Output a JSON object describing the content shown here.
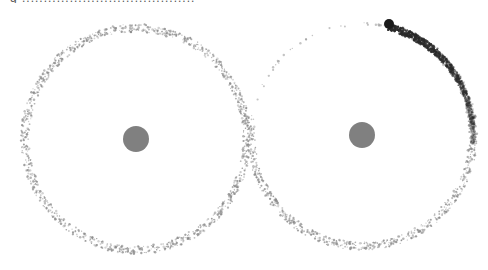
{
  "caption": {
    "text": "g ........................................"
  },
  "diagram": {
    "title": "",
    "colors": {
      "background": "#ffffff",
      "central_body": "#808080",
      "ring_particles": "#8a8a8a",
      "orbiting_body": "#1a1a1a",
      "trail": "#2a2a2a"
    },
    "systems": [
      {
        "id": "left",
        "center": [
          136,
          139
        ],
        "ring_radius": 111,
        "central_body_radius": 13,
        "ring_density": "uniform"
      },
      {
        "id": "right",
        "center": [
          362,
          135
        ],
        "ring_radius": 111,
        "central_body_radius": 13,
        "ring_density": "sparse top-left, dense elsewhere",
        "orbiting_body": {
          "position": [
            389,
            24
          ],
          "radius": 5
        },
        "trail": {
          "from_angle_deg": -75,
          "to_angle_deg": 5,
          "direction": "clockwise"
        }
      }
    ]
  }
}
